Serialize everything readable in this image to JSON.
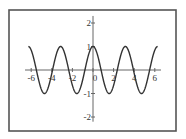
{
  "chart_data": {
    "type": "line",
    "title": "",
    "xlabel": "",
    "ylabel": "",
    "function": "cos(2x)",
    "xlim": [
      -6.6,
      6.6
    ],
    "ylim": [
      -2.2,
      2.3
    ],
    "x_domain": [
      -6.28,
      6.28
    ],
    "x_ticks": [
      -6,
      -4,
      -2,
      0,
      2,
      4,
      6
    ],
    "x_tick_labels": [
      "-6",
      "-4",
      "-2",
      "0",
      "2",
      "4",
      "6"
    ],
    "y_ticks": [
      2,
      1,
      -1,
      -2
    ],
    "y_tick_labels": [
      "2",
      "1",
      "-1",
      "-2"
    ],
    "grid": false,
    "legend": "none",
    "series": [
      {
        "name": "y = cos(2x)",
        "color": "#333333",
        "samples": 400
      }
    ]
  }
}
